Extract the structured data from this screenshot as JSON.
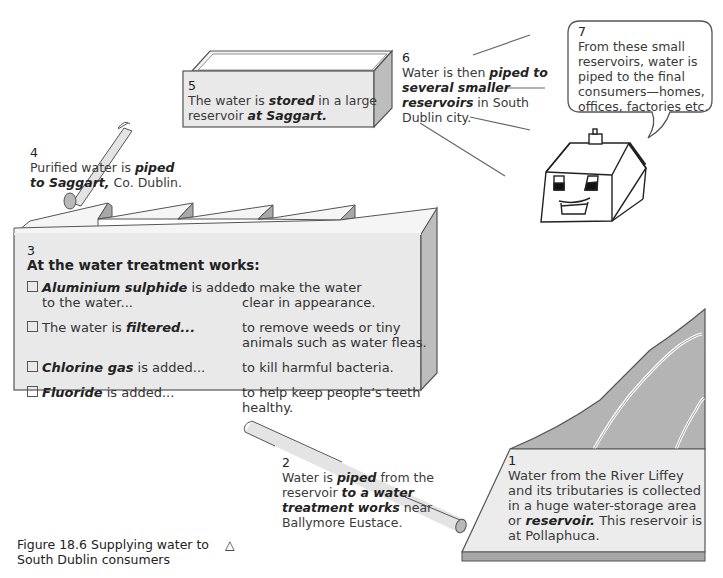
{
  "figure": {
    "caption_line1": "Figure 18.6  Supplying water to",
    "caption_line2": "South Dublin consumers",
    "caption_symbol": "△"
  },
  "steps": {
    "s1": {
      "num": "1",
      "lines": [
        "Water from the River Liffey",
        "and its tributaries is collected",
        "in a huge water-storage area"
      ],
      "line4_pre": "or ",
      "line4_em": "reservoir.",
      "line4_post": " This reservoir is",
      "line5": "at Pollaphuca."
    },
    "s2": {
      "num": "2",
      "l1_pre": "Water is ",
      "l1_em": "piped",
      "l1_post": " from the",
      "l2_pre": "reservoir ",
      "l2_em": "to a water",
      "l3_em": "treatment works",
      "l3_post": " near",
      "l4": "Ballymore Eustace."
    },
    "s3": {
      "num": "3",
      "heading": "At the water treatment works:",
      "rows": [
        {
          "em": "Aluminium sulphide",
          "rest": " is added",
          "rest2": "to the water...",
          "purpose1": "to make the water",
          "purpose2": "clear in appearance."
        },
        {
          "pre": "The water is ",
          "em": "filtered...",
          "purpose1": "to remove weeds or tiny",
          "purpose2": "animals such as water fleas."
        },
        {
          "em": "Chlorine gas",
          "rest": " is added...",
          "purpose1": "to kill harmful bacteria."
        },
        {
          "em": "Fluoride",
          "rest": " is added...",
          "purpose1": "to help keep people’s teeth",
          "purpose2": "healthy."
        }
      ]
    },
    "s4": {
      "num": "4",
      "l1_pre": "Purified water is ",
      "l1_em": "piped",
      "l2_em": "to Saggart,",
      "l2_post": " Co. Dublin."
    },
    "s5": {
      "num": "5",
      "l1_pre": "The water is ",
      "l1_em": "stored",
      "l1_post": " in a large",
      "l2_pre": "reservoir ",
      "l2_em": "at Saggart."
    },
    "s6": {
      "num": "6",
      "l1_pre": "Water is then ",
      "l1_em": "piped to",
      "l2_em": "several smaller",
      "l3_em": "reservoirs",
      "l3_post": " in South",
      "l4": "Dublin city."
    },
    "s7": {
      "num": "7",
      "lines": [
        "From these small",
        "reservoirs, water is",
        "piped to the final",
        "consumers—homes,",
        "offices, factories etc."
      ]
    }
  },
  "colors": {
    "panel": "#e9e9e9",
    "shade": "#bdbdbd",
    "dark": "#9a9a9a",
    "hill": "#b4b4b4",
    "line": "#555555"
  }
}
